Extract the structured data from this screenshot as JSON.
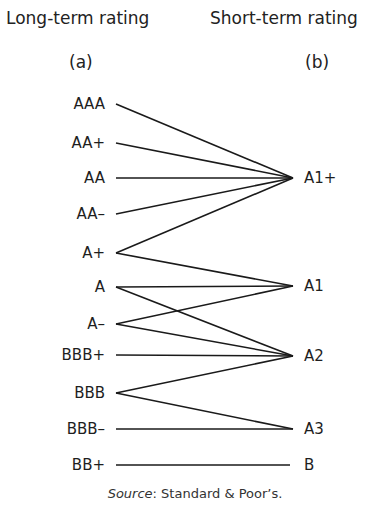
{
  "headers": {
    "left_title": "Long-term rating",
    "right_title": "Short-term rating",
    "left_sub": "(a)",
    "right_sub": "(b)"
  },
  "long_term": [
    {
      "label": "AAA",
      "y": 104
    },
    {
      "label": "AA+",
      "y": 143
    },
    {
      "label": "AA",
      "y": 178
    },
    {
      "label": "AA–",
      "y": 214
    },
    {
      "label": "A+",
      "y": 253
    },
    {
      "label": "A",
      "y": 287
    },
    {
      "label": "A–",
      "y": 324
    },
    {
      "label": "BBB+",
      "y": 355
    },
    {
      "label": "BBB",
      "y": 393
    },
    {
      "label": "BBB–",
      "y": 429
    },
    {
      "label": "BB+",
      "y": 465
    }
  ],
  "short_term": [
    {
      "label": "A1+",
      "y": 178
    },
    {
      "label": "A1",
      "y": 286
    },
    {
      "label": "A2",
      "y": 356
    },
    {
      "label": "A3",
      "y": 429
    },
    {
      "label": "B",
      "y": 465
    }
  ],
  "mappings": [
    {
      "from": "AAA",
      "to": "A1+"
    },
    {
      "from": "AA+",
      "to": "A1+"
    },
    {
      "from": "AA",
      "to": "A1+"
    },
    {
      "from": "AA–",
      "to": "A1+"
    },
    {
      "from": "A+",
      "to": "A1+"
    },
    {
      "from": "A+",
      "to": "A1"
    },
    {
      "from": "A",
      "to": "A1"
    },
    {
      "from": "A",
      "to": "A2"
    },
    {
      "from": "A–",
      "to": "A1"
    },
    {
      "from": "A–",
      "to": "A2"
    },
    {
      "from": "BBB+",
      "to": "A2"
    },
    {
      "from": "BBB",
      "to": "A2"
    },
    {
      "from": "BBB",
      "to": "A3"
    },
    {
      "from": "BBB–",
      "to": "A3"
    },
    {
      "from": "BB+",
      "to": "B"
    }
  ],
  "source": {
    "prefix": "Source",
    "text": ": Standard & Poor’s."
  },
  "colors": {
    "line": "#1a1a1a",
    "text": "#1e1e1e",
    "background": "#ffffff"
  }
}
